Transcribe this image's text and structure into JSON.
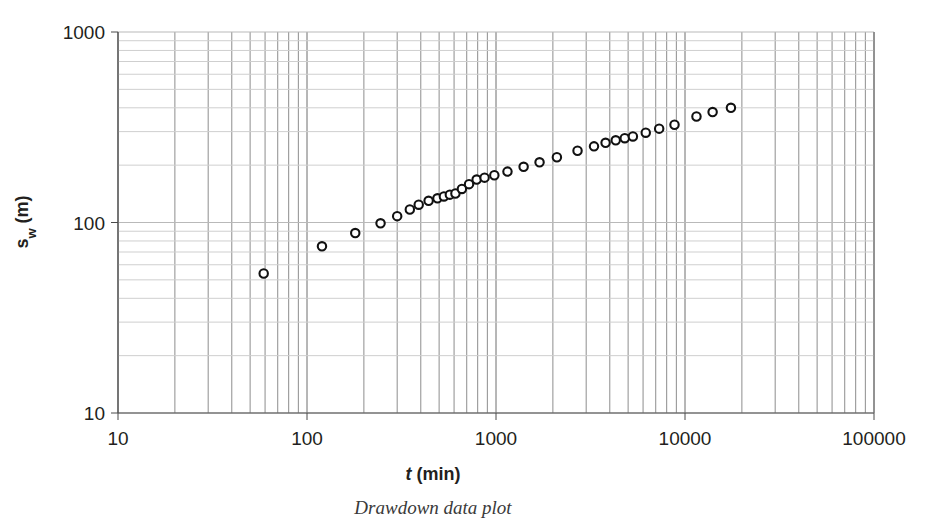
{
  "figure": {
    "caption": "Drawdown data plot"
  },
  "chart_data": {
    "type": "scatter",
    "title": "",
    "xlabel": "t (min)",
    "xlabel_main": "t",
    "xlabel_unit": "(min)",
    "ylabel": "sw (m)",
    "ylabel_main": "s",
    "ylabel_sub": "w",
    "ylabel_unit": "(m)",
    "xscale": "log",
    "yscale": "log",
    "xlim": [
      10,
      100000
    ],
    "ylim": [
      10,
      1000
    ],
    "xticks": [
      10,
      100,
      1000,
      10000,
      100000
    ],
    "xtick_labels": [
      "10",
      "100",
      "1000",
      "10000",
      "100000"
    ],
    "yticks": [
      10,
      100,
      1000
    ],
    "ytick_labels": [
      "10",
      "100",
      "1000"
    ],
    "grid": true,
    "minor_grid": true,
    "legend": null,
    "marker": "open-circle",
    "marker_color": "#111111",
    "x": [
      59,
      120,
      180,
      245,
      300,
      350,
      390,
      440,
      490,
      530,
      570,
      610,
      660,
      720,
      790,
      870,
      980,
      1150,
      1400,
      1700,
      2100,
      2700,
      3300,
      3800,
      4300,
      4800,
      5300,
      6200,
      7300,
      8800,
      11500,
      14000,
      17500
    ],
    "y": [
      54,
      75,
      88,
      99,
      108,
      117,
      124,
      130,
      134,
      137,
      140,
      142,
      150,
      159,
      168,
      172,
      177,
      185,
      196,
      207,
      220,
      238,
      251,
      262,
      270,
      277,
      283,
      296,
      311,
      326,
      360,
      380,
      400
    ],
    "n_points": 33
  }
}
